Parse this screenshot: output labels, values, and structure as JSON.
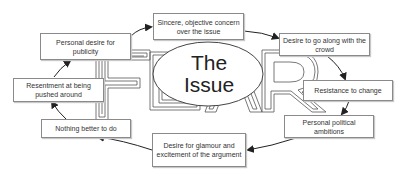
{
  "diagram": {
    "center": {
      "title_line1": "The",
      "title_line2": "Issue"
    },
    "background_word": "FEAR",
    "nodes": [
      {
        "id": "sincere",
        "label": "Sincere, objective concern over the issue"
      },
      {
        "id": "crowd",
        "label": "Desire to go along with the crowd"
      },
      {
        "id": "resistance",
        "label": "Resistance to change"
      },
      {
        "id": "political",
        "label": "Personal political ambitions"
      },
      {
        "id": "glamour",
        "label": "Desire for glamour and excitement of the argument"
      },
      {
        "id": "nothing",
        "label": "Nothing better to do"
      },
      {
        "id": "resentment",
        "label": "Resentment at being pushed around"
      },
      {
        "id": "publicity",
        "label": "Personal desire for publicity"
      }
    ],
    "cycle_order": [
      "sincere",
      "crowd",
      "resistance",
      "political",
      "glamour",
      "nothing",
      "resentment",
      "publicity",
      "sincere"
    ],
    "colors": {
      "line": "#333333",
      "box_border": "#8a8a8a",
      "letter_outline": "#555555",
      "text": "#333333"
    }
  }
}
